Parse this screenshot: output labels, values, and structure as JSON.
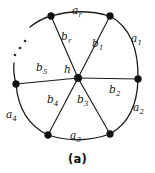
{
  "figure": {
    "caption": "(a)",
    "ellipsis_symbol": "⋯",
    "hub_label": "h",
    "colors": {
      "stroke": "#1b1b1b",
      "vertex": "#111111",
      "background": "#ffffff",
      "text": "#151515"
    },
    "spoke_labels": [
      {
        "base": "b",
        "sub": "r",
        "x": 62,
        "y": 32
      },
      {
        "base": "b",
        "sub": "1",
        "x": 93,
        "y": 39
      },
      {
        "base": "b",
        "sub": "2",
        "x": 110,
        "y": 85
      },
      {
        "base": "b",
        "sub": "3",
        "x": 78,
        "y": 95
      },
      {
        "base": "b",
        "sub": "4",
        "x": 48,
        "y": 95
      },
      {
        "base": "b",
        "sub": "5",
        "x": 37,
        "y": 63
      }
    ],
    "rim_labels": [
      {
        "base": "a",
        "sub": "r",
        "x": 72,
        "y": 6
      },
      {
        "base": "a",
        "sub": "1",
        "x": 131,
        "y": 34
      },
      {
        "base": "a",
        "sub": "2",
        "x": 133,
        "y": 103
      },
      {
        "base": "a",
        "sub": "3",
        "x": 70,
        "y": 131
      },
      {
        "base": "a",
        "sub": "4",
        "x": 7,
        "y": 110
      }
    ],
    "hub": {
      "x": 78,
      "y": 78,
      "label_x": 64,
      "label_y": 66
    },
    "vertices": [
      {
        "name": "rim-vertex-top-left",
        "x": 51,
        "y": 16
      },
      {
        "name": "rim-vertex-top-right",
        "x": 110,
        "y": 16
      },
      {
        "name": "rim-vertex-right",
        "x": 138,
        "y": 79
      },
      {
        "name": "rim-vertex-bottom-right",
        "x": 110,
        "y": 134
      },
      {
        "name": "rim-vertex-bottom-left",
        "x": 48,
        "y": 135
      },
      {
        "name": "rim-vertex-left",
        "x": 16,
        "y": 84
      }
    ],
    "ellipsis_dots": [
      {
        "x": 25,
        "y": 41
      },
      {
        "x": 20,
        "y": 48
      },
      {
        "x": 15,
        "y": 55
      }
    ]
  }
}
